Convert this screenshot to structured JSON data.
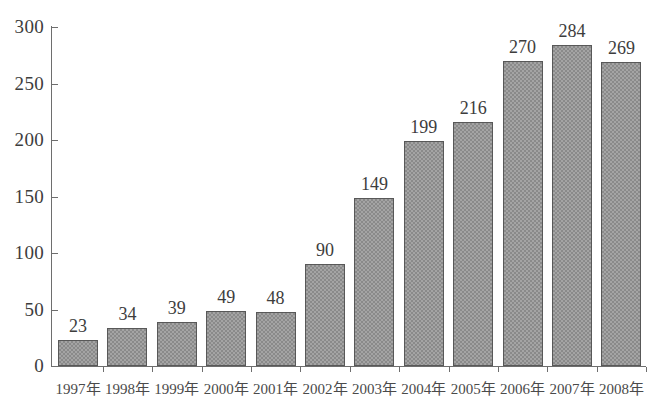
{
  "chart_data": {
    "type": "bar",
    "title": "",
    "subtitle": "",
    "xlabel": "",
    "ylabel": "",
    "ylim": [
      0,
      300
    ],
    "yticks": [
      0,
      50,
      100,
      150,
      200,
      250,
      300
    ],
    "ytick_labels": [
      "0",
      "50",
      "100",
      "150",
      "200",
      "250",
      "300"
    ],
    "grid": false,
    "legend": false,
    "legend_position": "none",
    "categories": [
      "1997年",
      "1998年",
      "1999年",
      "2000年",
      "2001年",
      "2002年",
      "2003年",
      "2004年",
      "2005年",
      "2006年",
      "2007年",
      "2008年"
    ],
    "values": [
      23,
      34,
      39,
      49,
      48,
      90,
      149,
      199,
      216,
      270,
      284,
      269
    ],
    "value_labels": [
      "23",
      "34",
      "39",
      "49",
      "48",
      "90",
      "149",
      "199",
      "216",
      "270",
      "284",
      "269"
    ],
    "bar_color": "#8a8a8a",
    "bar_border_color": "#585858",
    "axis_color": "#6e6e6e",
    "text_color": "#3d3d3d",
    "background_color": "#ffffff"
  }
}
